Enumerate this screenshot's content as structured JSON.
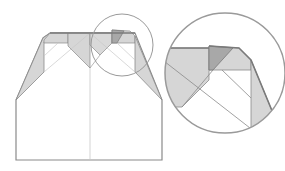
{
  "diagram": {
    "type": "origami-step",
    "colors": {
      "background": "#ffffff",
      "paper": "#ffffff",
      "outline": "#8a8a8a",
      "fold_shade": "#d6d6d6",
      "dark_shade": "#a8a8a8",
      "crease": "#c8c8c8",
      "magnifier": "#9a9a9a"
    },
    "main_model": {
      "label": "main-model"
    },
    "magnifier_small": {
      "label": "detail-marker"
    },
    "magnifier_large": {
      "label": "detail-view"
    }
  }
}
